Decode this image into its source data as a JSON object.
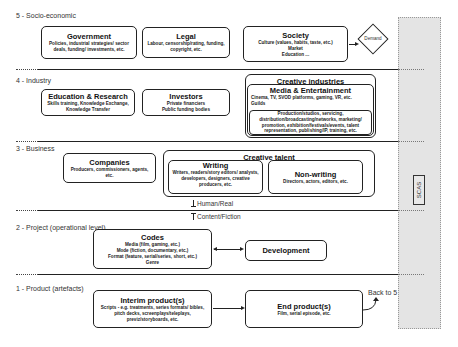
{
  "layers": [
    {
      "id": 5,
      "label": "5 - Socio-economic"
    },
    {
      "id": 4,
      "label": "4 - Industry"
    },
    {
      "id": 3,
      "label": "3 - Business"
    },
    {
      "id": 2,
      "label": "2 - Project (operational level)"
    },
    {
      "id": 1,
      "label": "1 - Product (artefacts)"
    }
  ],
  "socio_economic": {
    "government": {
      "title": "Government",
      "desc": "Policies, industrial strategies/ sector deals, funding/ investments, etc."
    },
    "legal": {
      "title": "Legal",
      "desc": "Labour, censorship/rating, funding, copyright, etc."
    },
    "society": {
      "title": "Society",
      "desc_lines": [
        "Culture (values, habits, taste, etc.)",
        "Market",
        "Education ..."
      ]
    },
    "demand": {
      "label": "Demand"
    }
  },
  "industry": {
    "education": {
      "title": "Education & Research",
      "desc": "Skills training, Knowledge Exchange, Knowledge Transfer"
    },
    "investors": {
      "title": "Investors",
      "desc_lines": [
        "Private financiers",
        "Public funding bodies"
      ]
    },
    "creative_industries": {
      "title": "Creative industries",
      "media": {
        "title": "Media & Entertainment",
        "desc1": "Cinema, TV, SVOD platforms, gaming, VR, etc.",
        "desc2": "Guilds",
        "desc3": "Production/studios, servicing, distribution/broadcasting/networks, marketing/ promotion, exhibition/festivals/events, talent representation, publishing/IP, training, etc."
      }
    }
  },
  "business": {
    "companies": {
      "title": "Companies",
      "desc": "Producers, commissioners, agents, etc."
    },
    "creative_talent": {
      "title": "Creative talent",
      "writing": {
        "title": "Writing",
        "desc": "Writers, readers/story editors/ analysts, developers, designers, creative producers, etc."
      },
      "non_writing": {
        "title": "Non-writing",
        "desc": "Directors, actors, editors, etc."
      }
    }
  },
  "boundary": {
    "human_real": "Human/Real",
    "content_fiction": "Content/Fiction"
  },
  "project": {
    "codes": {
      "title": "Codes",
      "desc_lines": [
        "Media (film, gaming, etc.)",
        "Mode (fiction, documentary, etc.)",
        "Format (feature, serial/series, short, etc.)",
        "Genre"
      ]
    },
    "development": {
      "title": "Development"
    }
  },
  "product": {
    "interim": {
      "title": "Interim product(s)",
      "desc": "Scripts - e.g. treatments, series formats/ bibles, pitch decks, screenplays/teleplays, previz/storyboards, etc."
    },
    "end": {
      "title": "End product(s)",
      "desc": "Film, serial episode, etc."
    },
    "back_to": "Back to 5"
  },
  "side_panel": {
    "label": "SCAS"
  }
}
